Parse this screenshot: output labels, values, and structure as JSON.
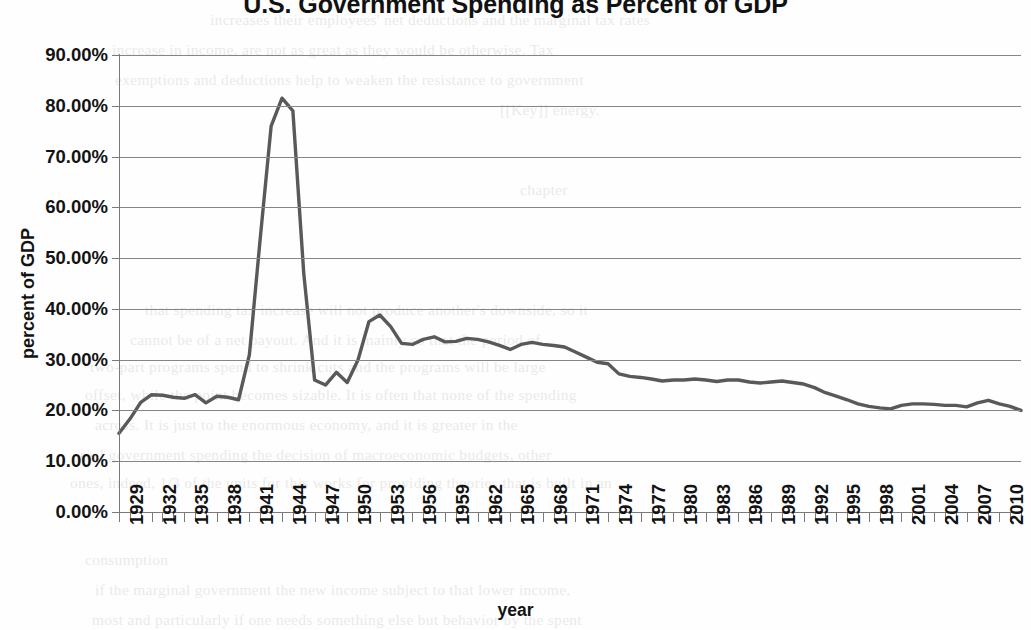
{
  "chart_data": {
    "type": "line",
    "title": "U.S. Government Spending as Percent of GDP",
    "xlabel": "year",
    "ylabel": "percent of GDP",
    "ylim": [
      0,
      0.9
    ],
    "xlim": [
      1929,
      2012
    ],
    "grid": true,
    "legend": "none",
    "line_color": "#595959",
    "y_tick_labels": [
      "90.00%",
      "80.00%",
      "70.00%",
      "60.00%",
      "50.00%",
      "40.00%",
      "30.00%",
      "20.00%",
      "10.00%",
      "0.00%"
    ],
    "y_tick_values": [
      90,
      80,
      70,
      60,
      50,
      40,
      30,
      20,
      10,
      0
    ],
    "x_tick_labels": [
      "1929",
      "1932",
      "1935",
      "1938",
      "1941",
      "1944",
      "1947",
      "1950",
      "1953",
      "1956",
      "1959",
      "1962",
      "1965",
      "1968",
      "1971",
      "1974",
      "1977",
      "1980",
      "1983",
      "1986",
      "1989",
      "1992",
      "1995",
      "1998",
      "2001",
      "2004",
      "2007",
      "2010"
    ],
    "x": [
      1929,
      1930,
      1931,
      1932,
      1933,
      1934,
      1935,
      1936,
      1937,
      1938,
      1939,
      1940,
      1941,
      1942,
      1943,
      1944,
      1945,
      1946,
      1947,
      1948,
      1949,
      1950,
      1951,
      1952,
      1953,
      1954,
      1955,
      1956,
      1957,
      1958,
      1959,
      1960,
      1961,
      1962,
      1963,
      1964,
      1965,
      1966,
      1967,
      1968,
      1969,
      1970,
      1971,
      1972,
      1973,
      1974,
      1975,
      1976,
      1977,
      1978,
      1979,
      1980,
      1981,
      1982,
      1983,
      1984,
      1985,
      1986,
      1987,
      1988,
      1989,
      1990,
      1991,
      1992,
      1993,
      1994,
      1995,
      1996,
      1997,
      1998,
      1999,
      2000,
      2001,
      2002,
      2003,
      2004,
      2005,
      2006,
      2007,
      2008,
      2009,
      2010,
      2011,
      2012
    ],
    "values": [
      15.5,
      18.3,
      21.6,
      23.1,
      23.0,
      22.6,
      22.4,
      23.1,
      21.5,
      22.8,
      22.6,
      22.1,
      31.0,
      54.0,
      76.0,
      81.5,
      79.0,
      47.0,
      26.0,
      25.0,
      27.5,
      25.5,
      30.0,
      37.5,
      38.8,
      36.5,
      33.2,
      33.0,
      34.0,
      34.5,
      33.5,
      33.6,
      34.2,
      34.0,
      33.5,
      32.8,
      32.0,
      33.0,
      33.4,
      33.0,
      32.8,
      32.5,
      31.5,
      30.5,
      29.5,
      29.2,
      27.2,
      26.7,
      26.5,
      26.2,
      25.8,
      26.0,
      26.0,
      26.2,
      26.0,
      25.7,
      26.0,
      26.0,
      25.6,
      25.4,
      25.6,
      25.8,
      25.5,
      25.2,
      24.5,
      23.5,
      22.8,
      22.1,
      21.3,
      20.8,
      20.5,
      20.3,
      21.0,
      21.3,
      21.3,
      21.2,
      21.0,
      21.0,
      20.7,
      21.5,
      22.0,
      21.3,
      20.8,
      20.0
    ]
  },
  "bleed_text": {
    "lines": [
      {
        "t": "increases their employees' net deductions and the marginal tax rates",
        "x": 210,
        "y": 5
      },
      {
        "t": "increase in income, are not as great as they would be otherwise. Tax",
        "x": 112,
        "y": 35
      },
      {
        "t": "exemptions and deductions help to weaken the resistance to government",
        "x": 115,
        "y": 65
      },
      {
        "t": "[[Key]] energy.",
        "x": 500,
        "y": 95
      },
      {
        "t": "chapter",
        "x": 520,
        "y": 175
      },
      {
        "t": "that spending tax increase will not produce another's downside, so it",
        "x": 145,
        "y": 295
      },
      {
        "t": "cannot be of a net payout. And it is mainly so that the period of",
        "x": 130,
        "y": 325
      },
      {
        "t": "two-part programs spend to shrink cuts and the programs will be large",
        "x": 90,
        "y": 352
      },
      {
        "t": "offset, while the point becomes sizable. It is often that none of the spending",
        "x": 85,
        "y": 380
      },
      {
        "t": "across. It is just to the enormous economy, and it is greater in the",
        "x": 95,
        "y": 410
      },
      {
        "t": "real government spending the decision of macroeconomic budgets, other",
        "x": 80,
        "y": 440
      },
      {
        "t": "ones, indeed, 1/3 of the units for this works for providing theories that is built in an",
        "x": 70,
        "y": 468
      },
      {
        "t": "consumption",
        "x": 85,
        "y": 545
      },
      {
        "t": "if the marginal government the new income subject to that lower income,",
        "x": 95,
        "y": 575
      },
      {
        "t": "most and particularly if one needs something else but behavior by the spent",
        "x": 92,
        "y": 605
      }
    ]
  }
}
